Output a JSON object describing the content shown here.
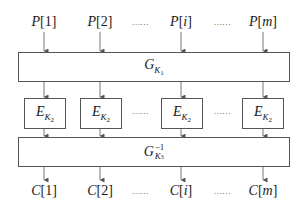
{
  "diagram": {
    "columns_x": [
      44,
      100,
      181,
      263
    ],
    "inputs": [
      {
        "var": "P",
        "index": "1"
      },
      {
        "var": "P",
        "index": "2"
      },
      {
        "var": "P",
        "index": "i"
      },
      {
        "var": "P",
        "index": "m"
      }
    ],
    "outputs": [
      {
        "var": "C",
        "index": "1"
      },
      {
        "var": "C",
        "index": "2"
      },
      {
        "var": "C",
        "index": "i"
      },
      {
        "var": "C",
        "index": "m"
      }
    ],
    "ellipsis": "……",
    "top_block": {
      "symbol": "G",
      "sub_var": "K",
      "sub_index": "1"
    },
    "middle_blocks": [
      {
        "symbol": "E",
        "sub_var": "K",
        "sub_index": "2"
      },
      {
        "symbol": "E",
        "sub_var": "K",
        "sub_index": "2"
      },
      {
        "symbol": "E",
        "sub_var": "K",
        "sub_index": "2"
      },
      {
        "symbol": "E",
        "sub_var": "K",
        "sub_index": "2"
      }
    ],
    "bottom_block": {
      "symbol": "G",
      "sub_var": "K",
      "sub_index": "3",
      "sup": "−1"
    },
    "colors": {
      "line": "#555555",
      "text": "#1a1a1a"
    }
  }
}
